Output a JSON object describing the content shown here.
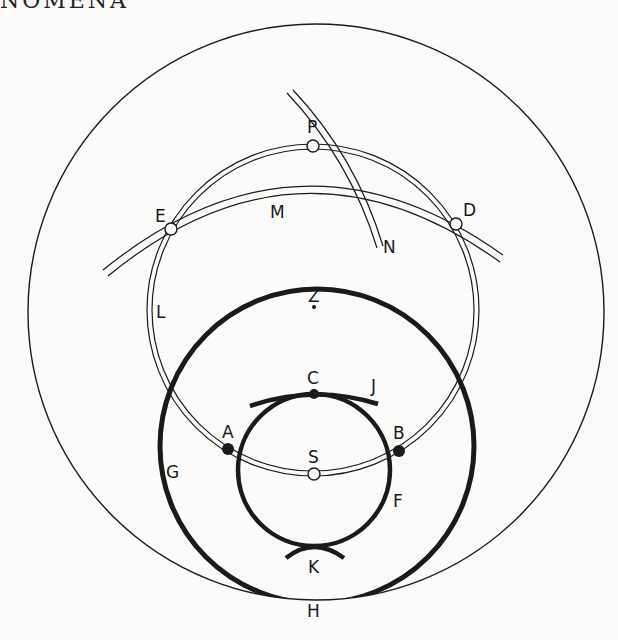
{
  "header": {
    "running_title": "NOMENA"
  },
  "diagram": {
    "labels": {
      "P": "P",
      "E": "E",
      "M": "M",
      "D": "D",
      "N": "N",
      "L": "L",
      "Z": "Z",
      "C": "C",
      "J": "J",
      "A": "A",
      "B": "B",
      "S": "S",
      "G": "G",
      "F": "F",
      "K": "K",
      "H": "H"
    },
    "colors": {
      "line": "#1a1a1a",
      "background": "#fbfbfa"
    }
  }
}
